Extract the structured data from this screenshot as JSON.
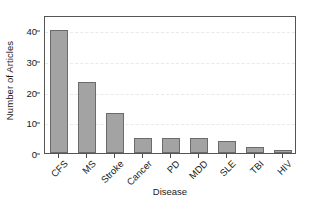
{
  "chart_data": {
    "type": "bar",
    "title": "",
    "xlabel": "Disease",
    "ylabel": "Number of Articles",
    "categories": [
      "CFS",
      "MS",
      "Stroke",
      "Cancer",
      "PD",
      "MDD",
      "SLE",
      "TBI",
      "HIV"
    ],
    "values": [
      40,
      23,
      13,
      5,
      5,
      5,
      4,
      2,
      1
    ],
    "ylim": [
      0,
      45
    ],
    "yticks": [
      0,
      10,
      20,
      30,
      40
    ],
    "ytick_labels": [
      "0",
      "10",
      "20",
      "30",
      "40"
    ],
    "grid": "horizontal-dashed",
    "legend": "none",
    "bar_color": "#a3a3a3",
    "bar_border_color": "#6b6b6b",
    "frame_color": "#555555",
    "gridline_color": "#e9e9e9",
    "xtick_label_rotation_degrees": -45
  }
}
